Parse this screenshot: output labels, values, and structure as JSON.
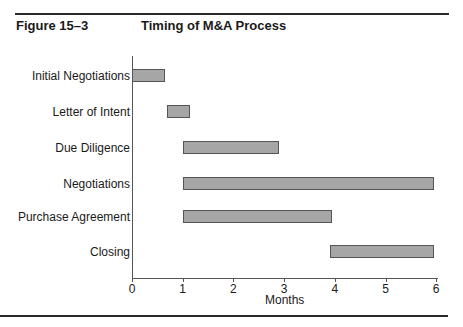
{
  "figure": {
    "number": "Figure 15–3",
    "title": "Timing of M&A Process"
  },
  "chart_data": {
    "type": "bar",
    "subtype": "gantt-horizontal",
    "title": "Timing of M&A Process",
    "xlabel": "Months",
    "ylabel": "",
    "xlim": [
      0,
      6
    ],
    "xticks": [
      "0",
      "1",
      "2",
      "3",
      "4",
      "5",
      "6"
    ],
    "grid": false,
    "legend": null,
    "categories": [
      "Initial Negotiations",
      "Letter of Intent",
      "Due Diligence",
      "Negotiations",
      "Purchase Agreement",
      "Closing"
    ],
    "series": [
      {
        "name": "start",
        "values": [
          0.0,
          0.7,
          1.0,
          1.0,
          1.0,
          3.9
        ]
      },
      {
        "name": "end",
        "values": [
          0.65,
          1.15,
          2.9,
          5.95,
          3.95,
          5.95
        ]
      }
    ],
    "bar_color": "#a6a6a6"
  }
}
